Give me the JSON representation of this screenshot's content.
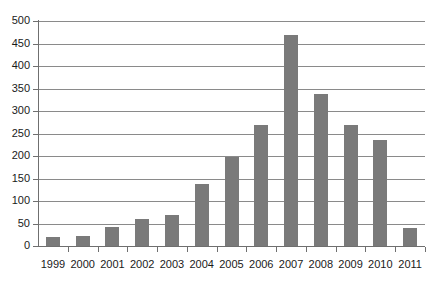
{
  "chart_data": {
    "type": "bar",
    "title": "",
    "subtitle": "",
    "xlabel": "",
    "ylabel": "",
    "categories": [
      "1999",
      "2000",
      "2001",
      "2002",
      "2003",
      "2004",
      "2005",
      "2006",
      "2007",
      "2008",
      "2009",
      "2010",
      "2011"
    ],
    "values": [
      19,
      23,
      42,
      60,
      70,
      137,
      197,
      268,
      470,
      338,
      270,
      235,
      40
    ],
    "ylim": [
      0,
      500
    ],
    "ytick_labels": [
      "500",
      "450",
      "400",
      "350",
      "300",
      "250",
      "200",
      "150",
      "100",
      "50",
      "0"
    ],
    "ytick_values": [
      500,
      450,
      400,
      350,
      300,
      250,
      200,
      150,
      100,
      50,
      0
    ],
    "ytick_step": 50,
    "grid": true,
    "grid_axis": "y",
    "legend": false,
    "legend_position": "none",
    "annotations": [],
    "series": [
      {
        "name": "",
        "values": [
          19,
          23,
          42,
          60,
          70,
          137,
          197,
          268,
          470,
          338,
          270,
          235,
          40
        ]
      }
    ]
  },
  "style": {
    "bar_color": "#7a7a7a",
    "gridline_color": "#8a8a8a",
    "axis_color": "#6f6f6f",
    "background": "#ffffff",
    "text_color": "#1a1a1a"
  }
}
